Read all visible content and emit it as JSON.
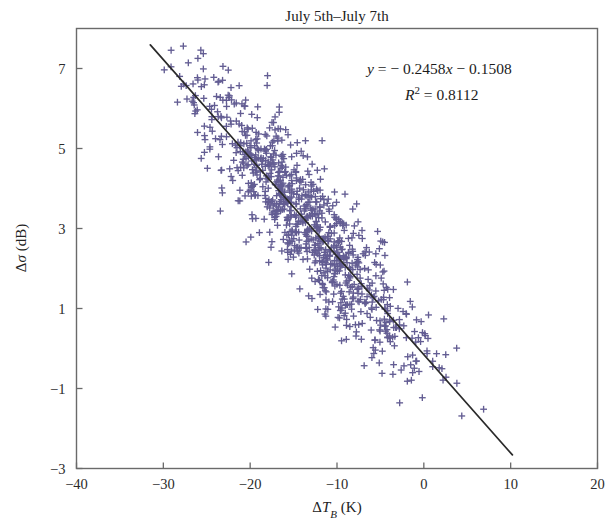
{
  "chart_data": {
    "type": "scatter",
    "title": "July 5th–July 7th",
    "xlabel": "ΔT_B (K)",
    "ylabel": "Δσ (dB)",
    "xlim": [
      -40,
      20
    ],
    "ylim": [
      -3,
      8
    ],
    "xticks": [
      -40,
      -30,
      -20,
      -10,
      0,
      10,
      20
    ],
    "xticklabels": [
      "−40",
      "−30",
      "−20",
      "−10",
      "0",
      "10",
      "20"
    ],
    "yticks": [
      7,
      5,
      3,
      1,
      -1,
      -3
    ],
    "yticklabels": [
      "7",
      "5",
      "3",
      "1",
      "−1",
      "−3"
    ],
    "grid": false,
    "legend": null,
    "marker_style": "plus",
    "marker_color": "#635d93",
    "fit_line_color": "#2a2a2a",
    "annotations": [
      {
        "id": "regression-equation",
        "text": "y = − 0.2458x − 0.1508",
        "slope": -0.2458,
        "intercept": -0.1508,
        "x": 0.5,
        "y": 6.85
      },
      {
        "id": "r-squared",
        "text": "R² = 0.8112",
        "value": 0.8112,
        "x": 0.5,
        "y": 6.0
      }
    ],
    "fit_line": {
      "x_start": -31.5,
      "x_end": 10.2,
      "y_start": 7.59,
      "y_end": -2.66
    },
    "series": [
      {
        "name": "ΔT_B vs Δσ",
        "n_points": 940,
        "x_range": [
          -32.0,
          10.5
        ],
        "y_range": [
          -1.7,
          7.7
        ],
        "correlation": -0.9007,
        "x_mean": -13.6,
        "y_mean": 3.19,
        "x_std": 6.6,
        "y_std": 1.82,
        "description": "Dense negatively-correlated cloud of plus markers concentrated between ΔT_B ≈ −26 and −2 K, Δσ ≈ 0 to 7 dB"
      }
    ]
  },
  "figure": {
    "background": "#ffffff",
    "frame_color": "#6a6a6a"
  }
}
